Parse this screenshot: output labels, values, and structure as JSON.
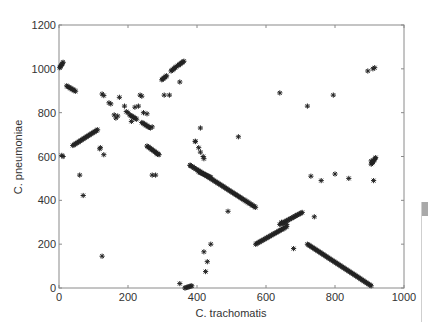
{
  "chart_data": {
    "type": "scatter",
    "title": "",
    "xlabel": "C. trachomatis",
    "ylabel": "C. pneumoniae",
    "xlim": [
      0,
      1000
    ],
    "ylim": [
      0,
      1200
    ],
    "xticks": [
      0,
      200,
      400,
      600,
      800,
      1000
    ],
    "yticks": [
      0,
      200,
      400,
      600,
      800,
      1000,
      1200
    ],
    "grid": false,
    "legend": null,
    "marker": "asterisk",
    "marker_color": "#222222",
    "segments": [
      {
        "from": [
          2,
          1005
        ],
        "to": [
          12,
          1030
        ]
      },
      {
        "from": [
          22,
          922
        ],
        "to": [
          48,
          898
        ]
      },
      {
        "from": [
          40,
          650
        ],
        "to": [
          112,
          722
        ]
      },
      {
        "from": [
          255,
          648
        ],
        "to": [
          290,
          608
        ]
      },
      {
        "from": [
          298,
          950
        ],
        "to": [
          312,
          968
        ]
      },
      {
        "from": [
          325,
          990
        ],
        "to": [
          340,
          1010
        ]
      },
      {
        "from": [
          345,
          1015
        ],
        "to": [
          362,
          1035
        ]
      },
      {
        "from": [
          205,
          790
        ],
        "to": [
          225,
          770
        ]
      },
      {
        "from": [
          240,
          755
        ],
        "to": [
          265,
          730
        ]
      },
      {
        "from": [
          380,
          560
        ],
        "to": [
          570,
          368
        ]
      },
      {
        "from": [
          405,
          530
        ],
        "to": [
          440,
          505
        ]
      },
      {
        "from": [
          570,
          200
        ],
        "to": [
          660,
          280
        ]
      },
      {
        "from": [
          640,
          290
        ],
        "to": [
          705,
          345
        ]
      },
      {
        "from": [
          720,
          200
        ],
        "to": [
          905,
          10
        ]
      },
      {
        "from": [
          365,
          0
        ],
        "to": [
          385,
          10
        ]
      },
      {
        "from": [
          905,
          565
        ],
        "to": [
          918,
          595
        ]
      }
    ],
    "points": [
      [
        8,
        605
      ],
      [
        12,
        600
      ],
      [
        120,
        640
      ],
      [
        118,
        635
      ],
      [
        130,
        608
      ],
      [
        60,
        515
      ],
      [
        70,
        422
      ],
      [
        125,
        145
      ],
      [
        125,
        885
      ],
      [
        130,
        878
      ],
      [
        145,
        845
      ],
      [
        150,
        840
      ],
      [
        160,
        790
      ],
      [
        170,
        785
      ],
      [
        165,
        775
      ],
      [
        175,
        870
      ],
      [
        190,
        830
      ],
      [
        195,
        805
      ],
      [
        200,
        800
      ],
      [
        210,
        760
      ],
      [
        220,
        825
      ],
      [
        230,
        830
      ],
      [
        235,
        880
      ],
      [
        240,
        875
      ],
      [
        245,
        800
      ],
      [
        255,
        795
      ],
      [
        270,
        735
      ],
      [
        285,
        610
      ],
      [
        270,
        515
      ],
      [
        280,
        515
      ],
      [
        305,
        880
      ],
      [
        320,
        880
      ],
      [
        350,
        940
      ],
      [
        380,
        560
      ],
      [
        395,
        668
      ],
      [
        395,
        670
      ],
      [
        410,
        730
      ],
      [
        405,
        640
      ],
      [
        418,
        600
      ],
      [
        420,
        590
      ],
      [
        410,
        620
      ],
      [
        520,
        690
      ],
      [
        490,
        350
      ],
      [
        640,
        890
      ],
      [
        720,
        830
      ],
      [
        795,
        880
      ],
      [
        730,
        510
      ],
      [
        760,
        490
      ],
      [
        800,
        520
      ],
      [
        840,
        500
      ],
      [
        895,
        990
      ],
      [
        910,
        1000
      ],
      [
        915,
        1005
      ],
      [
        912,
        490
      ],
      [
        905,
        580
      ],
      [
        910,
        575
      ],
      [
        680,
        180
      ],
      [
        740,
        325
      ],
      [
        645,
        300
      ],
      [
        650,
        295
      ],
      [
        660,
        290
      ],
      [
        420,
        165
      ],
      [
        440,
        200
      ],
      [
        430,
        120
      ],
      [
        425,
        75
      ],
      [
        350,
        20
      ]
    ]
  }
}
